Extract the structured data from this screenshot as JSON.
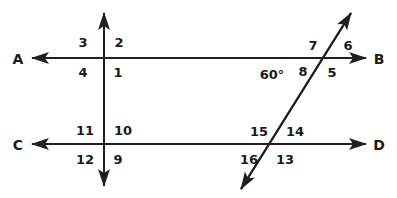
{
  "diagram": {
    "type": "transversal-parallel-lines-geometry",
    "canvas": {
      "width": 397,
      "height": 198
    },
    "stroke_color": "#231f20",
    "background_color": "#ffffff",
    "lines": [
      {
        "name": "line-AB",
        "label_start": "A",
        "label_end": "B",
        "orientation": "horizontal",
        "y": 58,
        "x1": 32,
        "x2": 366,
        "arrows": "both"
      },
      {
        "name": "line-CD",
        "label_start": "C",
        "label_end": "D",
        "orientation": "horizontal",
        "y": 144,
        "x1": 32,
        "x2": 366,
        "arrows": "both"
      },
      {
        "name": "vertical-transversal",
        "orientation": "vertical",
        "x": 104,
        "y1": 13,
        "y2": 186,
        "arrows": "both"
      },
      {
        "name": "oblique-transversal",
        "orientation": "oblique",
        "x1": 241,
        "y1": 189,
        "x2": 351,
        "y2": 13,
        "arrows": "both"
      }
    ],
    "line_endpoint_labels": [
      {
        "name": "label-A",
        "text": "A",
        "x": 18,
        "y": 59
      },
      {
        "name": "label-B",
        "text": "B",
        "x": 379,
        "y": 59
      },
      {
        "name": "label-C",
        "text": "C",
        "x": 18,
        "y": 145
      },
      {
        "name": "label-D",
        "text": "D",
        "x": 379,
        "y": 145
      }
    ],
    "angle_numbers": [
      {
        "name": "angle-1",
        "text": "1",
        "x": 118,
        "y": 72
      },
      {
        "name": "angle-2",
        "text": "2",
        "x": 119,
        "y": 42
      },
      {
        "name": "angle-3",
        "text": "3",
        "x": 83,
        "y": 42
      },
      {
        "name": "angle-4",
        "text": "4",
        "x": 83,
        "y": 72
      },
      {
        "name": "angle-5",
        "text": "5",
        "x": 332,
        "y": 72
      },
      {
        "name": "angle-6",
        "text": "6",
        "x": 348,
        "y": 45
      },
      {
        "name": "angle-7",
        "text": "7",
        "x": 313,
        "y": 45
      },
      {
        "name": "angle-8",
        "text": "8",
        "x": 303,
        "y": 71
      },
      {
        "name": "angle-9",
        "text": "9",
        "x": 118,
        "y": 159
      },
      {
        "name": "angle-10",
        "text": "10",
        "x": 123,
        "y": 130
      },
      {
        "name": "angle-11",
        "text": "11",
        "x": 85,
        "y": 130
      },
      {
        "name": "angle-12",
        "text": "12",
        "x": 85,
        "y": 159
      },
      {
        "name": "angle-13",
        "text": "13",
        "x": 285,
        "y": 159
      },
      {
        "name": "angle-14",
        "text": "14",
        "x": 295,
        "y": 131
      },
      {
        "name": "angle-15",
        "text": "15",
        "x": 259,
        "y": 131
      },
      {
        "name": "angle-16",
        "text": "16",
        "x": 249,
        "y": 159
      }
    ],
    "angle_measures": [
      {
        "name": "angle-measure-60",
        "text": "60°",
        "x": 272,
        "y": 74
      }
    ]
  }
}
